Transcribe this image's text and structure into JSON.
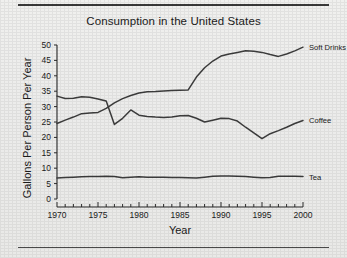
{
  "figure": {
    "top_rule": true,
    "bottom_rule": true,
    "background_color": "#eeeeec",
    "line_color": "#3c3c3c"
  },
  "chart_data": {
    "type": "line",
    "title": "Consumption in the United States",
    "xlabel": "Year",
    "ylabel": "Gallons Per Person Per Year",
    "xlim": [
      1970,
      2000
    ],
    "ylim": [
      0,
      50
    ],
    "ytick_labels": [
      "0",
      "5",
      "10",
      "15",
      "20",
      "25",
      "30",
      "35",
      "40",
      "45",
      "50"
    ],
    "yticks": [
      0,
      5,
      10,
      15,
      20,
      25,
      30,
      35,
      40,
      45,
      50
    ],
    "xtick_labels": [
      "1970",
      "1975",
      "1980",
      "1985",
      "1990",
      "1995",
      "2000"
    ],
    "xticks": [
      1970,
      1975,
      1980,
      1985,
      1990,
      1995,
      2000
    ],
    "xminor_tick_step": 1,
    "grid": false,
    "legend_position": "right-of-line-ends",
    "x": [
      1970,
      1971,
      1972,
      1973,
      1974,
      1975,
      1976,
      1977,
      1978,
      1979,
      1980,
      1981,
      1982,
      1983,
      1984,
      1985,
      1986,
      1987,
      1988,
      1989,
      1990,
      1991,
      1992,
      1993,
      1994,
      1995,
      1996,
      1997,
      1998,
      1999,
      2000
    ],
    "series": [
      {
        "name": "Soft Drinks",
        "label": "Soft Drinks",
        "values": [
          24.5,
          25.6,
          26.6,
          27.7,
          27.9,
          28.1,
          29.4,
          31.2,
          32.6,
          33.6,
          34.4,
          34.8,
          34.9,
          35.1,
          35.2,
          35.3,
          35.4,
          39.6,
          42.6,
          44.8,
          46.4,
          47.1,
          47.6,
          48.1,
          48.0,
          47.6,
          46.9,
          46.3,
          47.1,
          48.1,
          49.3
        ]
      },
      {
        "name": "Coffee",
        "label": "Coffee",
        "values": [
          33.4,
          32.6,
          32.7,
          33.2,
          33.0,
          32.5,
          31.8,
          24.2,
          26.2,
          28.9,
          27.2,
          26.8,
          26.6,
          26.5,
          26.6,
          27.0,
          27.1,
          26.2,
          25.0,
          25.6,
          26.2,
          26.1,
          25.3,
          23.3,
          21.5,
          19.6,
          21.2,
          22.2,
          23.3,
          24.5,
          25.5
        ]
      },
      {
        "name": "Tea",
        "label": "Tea",
        "values": [
          6.8,
          7.0,
          7.1,
          7.2,
          7.3,
          7.3,
          7.4,
          7.3,
          6.9,
          7.1,
          7.2,
          7.1,
          7.1,
          7.1,
          7.0,
          7.0,
          6.9,
          6.8,
          7.1,
          7.4,
          7.5,
          7.5,
          7.4,
          7.3,
          7.1,
          6.9,
          7.0,
          7.4,
          7.4,
          7.4,
          7.3
        ]
      }
    ]
  }
}
